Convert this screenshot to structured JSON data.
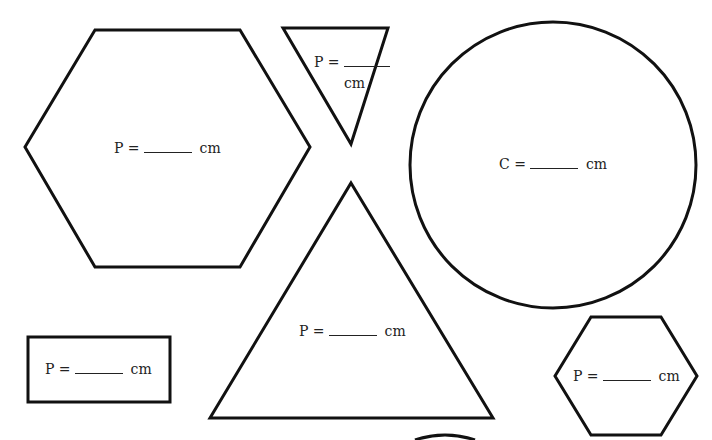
{
  "worksheet": {
    "shapes": [
      {
        "id": "large-hexagon",
        "type": "hexagon",
        "label": {
          "var": "P =",
          "unit": "cm"
        }
      },
      {
        "id": "small-inverted-triangle",
        "type": "inverted-triangle",
        "label": {
          "var": "P =",
          "unit": "cm"
        }
      },
      {
        "id": "circle",
        "type": "circle",
        "label": {
          "var": "C =",
          "unit": "cm"
        }
      },
      {
        "id": "large-triangle",
        "type": "triangle",
        "label": {
          "var": "P =",
          "unit": "cm"
        }
      },
      {
        "id": "rectangle",
        "type": "rectangle",
        "label": {
          "var": "P =",
          "unit": "cm"
        }
      },
      {
        "id": "small-hexagon",
        "type": "hexagon",
        "label": {
          "var": "P =",
          "unit": "cm"
        }
      }
    ],
    "colors": {
      "stroke": "#111111",
      "background": "#ffffff",
      "text": "#222222"
    }
  }
}
